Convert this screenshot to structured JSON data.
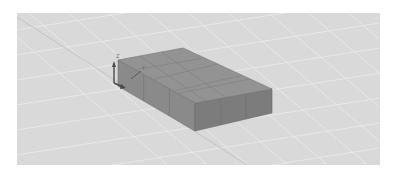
{
  "viewport": {
    "background": "#d9d9d9",
    "grid_color": "#e8e8e8",
    "ground_line_color": "#b8b8b8"
  },
  "model": {
    "name": "box",
    "rows": 3,
    "cols": 5,
    "top_color": "#8f8f8f",
    "front_color": "#7a7a7a",
    "left_color": "#858585",
    "edge_color": "#6e6e6e"
  },
  "gizmo": {
    "axes": [
      "Z",
      "Y",
      "X"
    ],
    "color": "#4a4a4a"
  }
}
